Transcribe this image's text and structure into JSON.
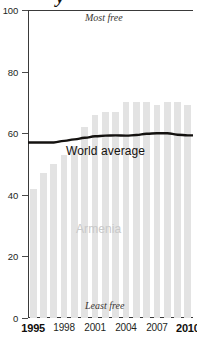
{
  "title_fragment": "y",
  "chart_data": {
    "type": "bar",
    "title": "",
    "xlabel": "",
    "ylabel": "",
    "ylim": [
      0,
      100
    ],
    "xlim": [
      1995,
      2010
    ],
    "grid": false,
    "legend": "inline-annotations",
    "y_ticks": [
      0,
      20,
      40,
      60,
      80,
      100
    ],
    "x_ticks": [
      1995,
      1998,
      2001,
      2004,
      2007,
      2010
    ],
    "x_tick_labels": [
      "1995",
      "1998",
      "2001",
      "2004",
      "2007",
      "2010"
    ],
    "categories": [
      1995,
      1996,
      1997,
      1998,
      1999,
      2000,
      2001,
      2002,
      2003,
      2004,
      2005,
      2006,
      2007,
      2008,
      2009,
      2010
    ],
    "series": [
      {
        "name": "Armenia",
        "type": "bar",
        "color": "#e3e3e3",
        "values": [
          42,
          47,
          50,
          53,
          56,
          62,
          66,
          67,
          67,
          70,
          70,
          70,
          69,
          70,
          70,
          69
        ]
      },
      {
        "name": "World average",
        "type": "line",
        "color": "#141210",
        "values": [
          57,
          57,
          57,
          57.5,
          58,
          58.5,
          59,
          59.2,
          59.3,
          59.2,
          59.4,
          59.8,
          60,
          60,
          59.5,
          59.3
        ]
      }
    ],
    "annotations": [
      {
        "text": "Most free",
        "position": "top-center",
        "style": "italic"
      },
      {
        "text": "Least free",
        "position": "bottom-center",
        "style": "italic"
      },
      {
        "text": "World average",
        "position": "on-line",
        "style": "plain"
      },
      {
        "text": "Armenia",
        "position": "in-bars",
        "style": "plain",
        "color": "#c9c9c9"
      }
    ]
  },
  "labels": {
    "most_free": "Most free",
    "least_free": "Least free",
    "world_average": "World average",
    "armenia": "Armenia"
  },
  "colors": {
    "bar": "#e3e3e3",
    "line": "#141210",
    "axis": "#3a3a3a",
    "armenia_label": "#c9c9c9",
    "text": "#231f1c",
    "background": "#ffffff"
  }
}
